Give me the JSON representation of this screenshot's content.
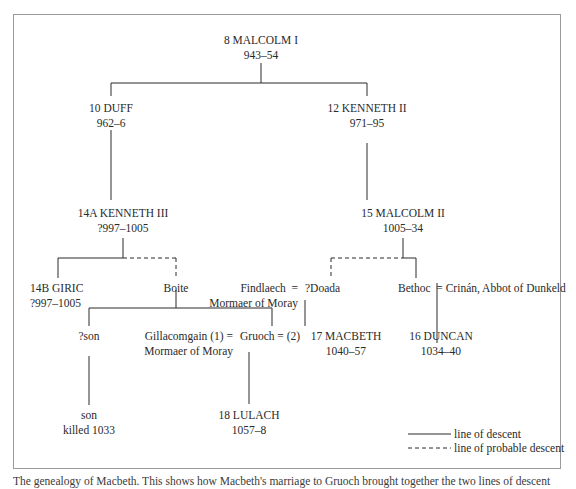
{
  "nodes": {
    "malcolm1": {
      "name": "8 MALCOLM I",
      "reign": "943–54"
    },
    "duff": {
      "name": "10 DUFF",
      "reign": "962–6"
    },
    "kenneth2": {
      "name": "12 KENNETH II",
      "reign": "971–95"
    },
    "kenneth3": {
      "name": "14A KENNETH III",
      "reign": "?997–1005"
    },
    "malcolm2": {
      "name": "15 MALCOLM II",
      "reign": "1005–34"
    },
    "giric": {
      "name": "14B GIRIC",
      "reign": "?997–1005"
    },
    "boite": {
      "name": "Boite"
    },
    "findlaech": {
      "name": "Findlaech",
      "title": "Mormaer of Moray",
      "spouse_sep": "="
    },
    "doada": {
      "name": "?Doada"
    },
    "bethoc": {
      "name": "Bethoc",
      "spouse_sep": "="
    },
    "crinan": {
      "name": "Crinán, Abbot of Dunkeld"
    },
    "son1": {
      "name": "?son"
    },
    "gillacomgain": {
      "name": "Gillacomgain (1) =",
      "title": "Mormaer of Moray"
    },
    "gruoch": {
      "name": "Gruoch = (2)"
    },
    "macbeth": {
      "name": "17 MACBETH",
      "reign": "1040–57"
    },
    "duncan": {
      "name": "16 DUNCAN",
      "reign": "1034–40"
    },
    "son2": {
      "name": "son",
      "note": "killed 1033"
    },
    "lulach": {
      "name": "18 LULACH",
      "reign": "1057–8"
    }
  },
  "legend": {
    "solid": "line of descent",
    "dashed": "line of probable descent"
  },
  "caption": "The genealogy of Macbeth. This shows how Macbeth's marriage to Gruoch brought together the two lines of descent",
  "colors": {
    "line": "#2a2a2a",
    "frame": "#9a9a9a",
    "text": "#2a2a2a"
  }
}
